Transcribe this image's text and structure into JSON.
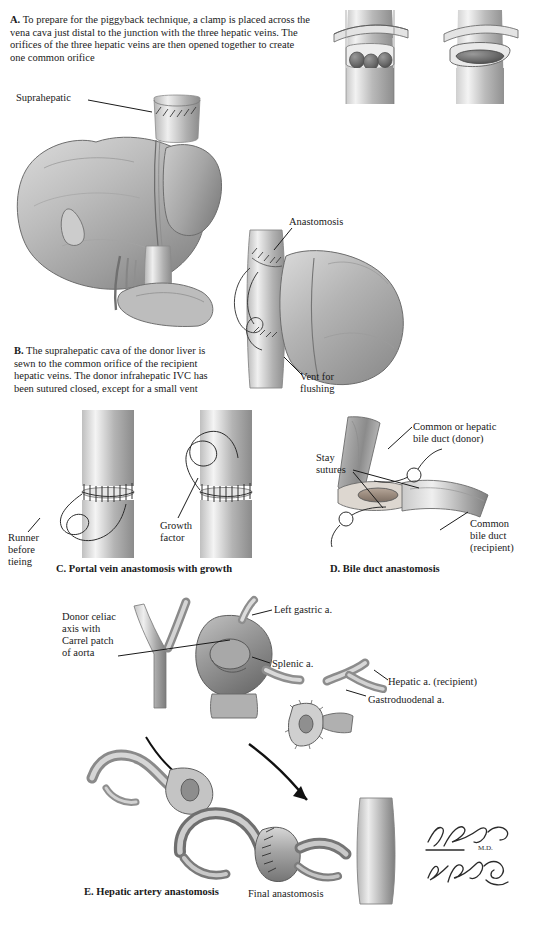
{
  "figure": {
    "background": "#ffffff",
    "ink": "#1a1a1a"
  },
  "panels": {
    "a": {
      "id": "A.",
      "caption": "To prepare for the piggyback technique, a clamp is placed across the vena cava just distal to the junction with the three hepatic veins. The orifices of the three hepatic veins are then opened together to create one common orifice",
      "labels": [
        {
          "key": "suprahepatic",
          "text": "Suprahepatic"
        }
      ]
    },
    "b": {
      "id": "B.",
      "caption": "The suprahepatic cava of the donor liver is sewn to the common orifice of the recipient hepatic veins. The donor infrahepatic IVC has been sutured closed, except for a small vent",
      "labels": [
        {
          "key": "anastomosis",
          "text": "Anastomosis"
        },
        {
          "key": "vent",
          "text": "Vent for\nflushing",
          "line1": "Vent for",
          "line2": "flushing"
        }
      ]
    },
    "c": {
      "id": "C.",
      "title": "C. Portal vein anastomosis with growth",
      "labels": [
        {
          "key": "runner",
          "line1": "Runner",
          "line2": "before",
          "line3": "tieing"
        },
        {
          "key": "growth",
          "line1": "Growth",
          "line2": "factor"
        }
      ]
    },
    "d": {
      "id": "D.",
      "title": "D. Bile duct anastomosis",
      "labels": [
        {
          "key": "donor-duct",
          "line1": "Common or hepatic",
          "line2": "bile duct (donor)"
        },
        {
          "key": "stay-sutures",
          "line1": "Stay",
          "line2": "sutures"
        },
        {
          "key": "recipient-duct",
          "line1": "Common",
          "line2": "bile duct",
          "line3": "(recipient)"
        }
      ]
    },
    "e": {
      "id": "E.",
      "title": "E. Hepatic artery anastomosis",
      "final_label": "Final anastomosis",
      "labels": [
        {
          "key": "celiac",
          "line1": "Donor celiac",
          "line2": "axis with",
          "line3": "Carrel patch",
          "line4": "of aorta"
        },
        {
          "key": "left-gastric",
          "text": "Left gastric a."
        },
        {
          "key": "splenic",
          "text": "Splenic a."
        },
        {
          "key": "hepatic-recipient",
          "text": "Hepatic a. (recipient)"
        },
        {
          "key": "gastroduodenal",
          "text": "Gastroduodenal a."
        }
      ]
    }
  },
  "signature": {
    "line1": "F. Netter",
    "line2": "M.D.",
    "line3": "K. Marazzi"
  }
}
